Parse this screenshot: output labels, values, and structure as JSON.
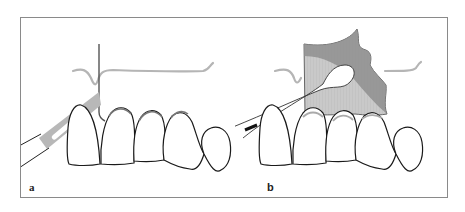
{
  "figure": {
    "panels": [
      {
        "label": "a",
        "elements": [
          "gingival-line",
          "vertical-incision-line",
          "scalpel-blade",
          "teeth-row",
          "gingival-margin-shading"
        ]
      },
      {
        "label": "b",
        "elements": [
          "gingival-line",
          "gingival-flap-shaded",
          "cotton-swab",
          "teeth-row",
          "gingival-margin-shading"
        ]
      }
    ],
    "colors": {
      "frame": "#8a8a8a",
      "outline": "#1a1a1a",
      "gingiva_line": "#b5b5b5",
      "blade": "#b8b8b8",
      "flap_light": "#c9c9c9",
      "flap_dark": "#8f8f8f",
      "incision": "#555555"
    }
  }
}
